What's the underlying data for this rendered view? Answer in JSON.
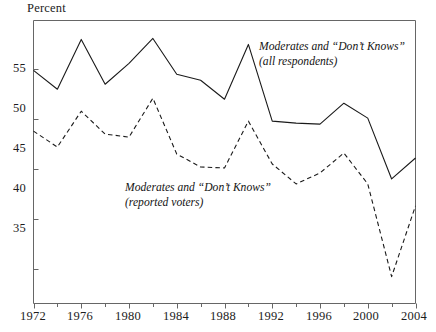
{
  "axis": {
    "y_title": "Percent",
    "y_ticks": [
      {
        "label": "55",
        "value": 55
      },
      {
        "label": "50",
        "value": 50
      },
      {
        "label": "45",
        "value": 45
      },
      {
        "label": "40",
        "value": 40
      },
      {
        "label": "35",
        "value": 35
      }
    ],
    "x_ticks": [
      {
        "label": "1972",
        "value": 1972
      },
      {
        "label": "1976",
        "value": 1976
      },
      {
        "label": "1980",
        "value": 1980
      },
      {
        "label": "1984",
        "value": 1984
      },
      {
        "label": "1988",
        "value": 1988
      },
      {
        "label": "1992",
        "value": 1992
      },
      {
        "label": "1996",
        "value": 1996
      },
      {
        "label": "2000",
        "value": 2000
      },
      {
        "label": "2004",
        "value": 2004
      }
    ]
  },
  "annotations": {
    "all_respondents": {
      "line1": "Moderates and “Don’t Knows”",
      "line2": "(all respondents)"
    },
    "reported_voters": {
      "line1": "Moderates and “Don’t Knows”",
      "line2": "(reported voters)"
    }
  },
  "colors": {
    "line": "#1a1a1a",
    "axis": "#555555",
    "background": "#ffffff"
  },
  "chart_data": {
    "type": "line",
    "title": "",
    "xlabel": "",
    "ylabel": "Percent",
    "xlim": [
      1972,
      2004
    ],
    "ylim": [
      31.5,
      59.9
    ],
    "grid": false,
    "legend_position": "inline-annotation",
    "x": [
      1972,
      1974,
      1976,
      1978,
      1980,
      1982,
      1984,
      1986,
      1988,
      1990,
      1992,
      1994,
      1996,
      1998,
      2000,
      2002,
      2004
    ],
    "series": [
      {
        "name": "Moderates and “Don’t Knows” (all respondents)",
        "style": "solid",
        "values": [
          54.9,
          53.0,
          58.0,
          53.5,
          55.6,
          58.1,
          54.5,
          53.9,
          52.0,
          57.5,
          49.8,
          49.6,
          49.5,
          51.6,
          50.1,
          44.0,
          46.1
        ]
      },
      {
        "name": "Moderates and “Don’t Knows” (reported voters)",
        "style": "dashed",
        "values": [
          48.8,
          47.2,
          50.8,
          48.5,
          48.2,
          52.1,
          46.5,
          45.2,
          45.1,
          49.8,
          45.5,
          43.5,
          44.6,
          46.6,
          43.5,
          34.2,
          41.3
        ]
      }
    ]
  }
}
